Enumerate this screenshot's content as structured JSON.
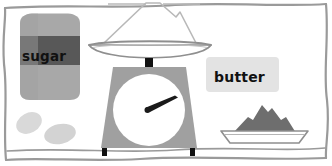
{
  "scene": {
    "title": "Kitchen scale with ingredients",
    "width": 332,
    "height": 166,
    "background": "#ffffff",
    "border": {
      "name": "hand-drawn-frame",
      "color": "#9a9a9a",
      "style": "wavy-freehand-rectangle"
    }
  },
  "labels": {
    "sugar": "sugar",
    "butter": "butter"
  },
  "objects": [
    {
      "name": "sugar-bag",
      "label": "sugar",
      "body_color": "#a8a8a8",
      "band_color": "#585858",
      "text_color": "#111111"
    },
    {
      "name": "eggs",
      "count": 2,
      "color": "#d9d9d9"
    },
    {
      "name": "kitchen-scale",
      "body_color": "#a0a0a0",
      "dial_color": "#ffffff",
      "needle_color": "#1a1a1a",
      "pan_color": "#ffffff",
      "pan_outline": "#8f8f8f",
      "foot_color": "#111111"
    },
    {
      "name": "butter-label-card",
      "label": "butter",
      "card_color": "#e3e3e3",
      "text_color": "#111111"
    },
    {
      "name": "plate-with-mound",
      "plate_color": "#ffffff",
      "plate_outline": "#8f8f8f",
      "mound_color": "#6e6e6e"
    }
  ],
  "colors": {
    "frame": "#9a9a9a",
    "mid_gray": "#a0a0a0",
    "light_gray": "#d9d9d9",
    "dark_gray": "#585858",
    "mound_gray": "#6e6e6e",
    "card_gray": "#e3e3e3",
    "black": "#111111",
    "white": "#ffffff"
  }
}
